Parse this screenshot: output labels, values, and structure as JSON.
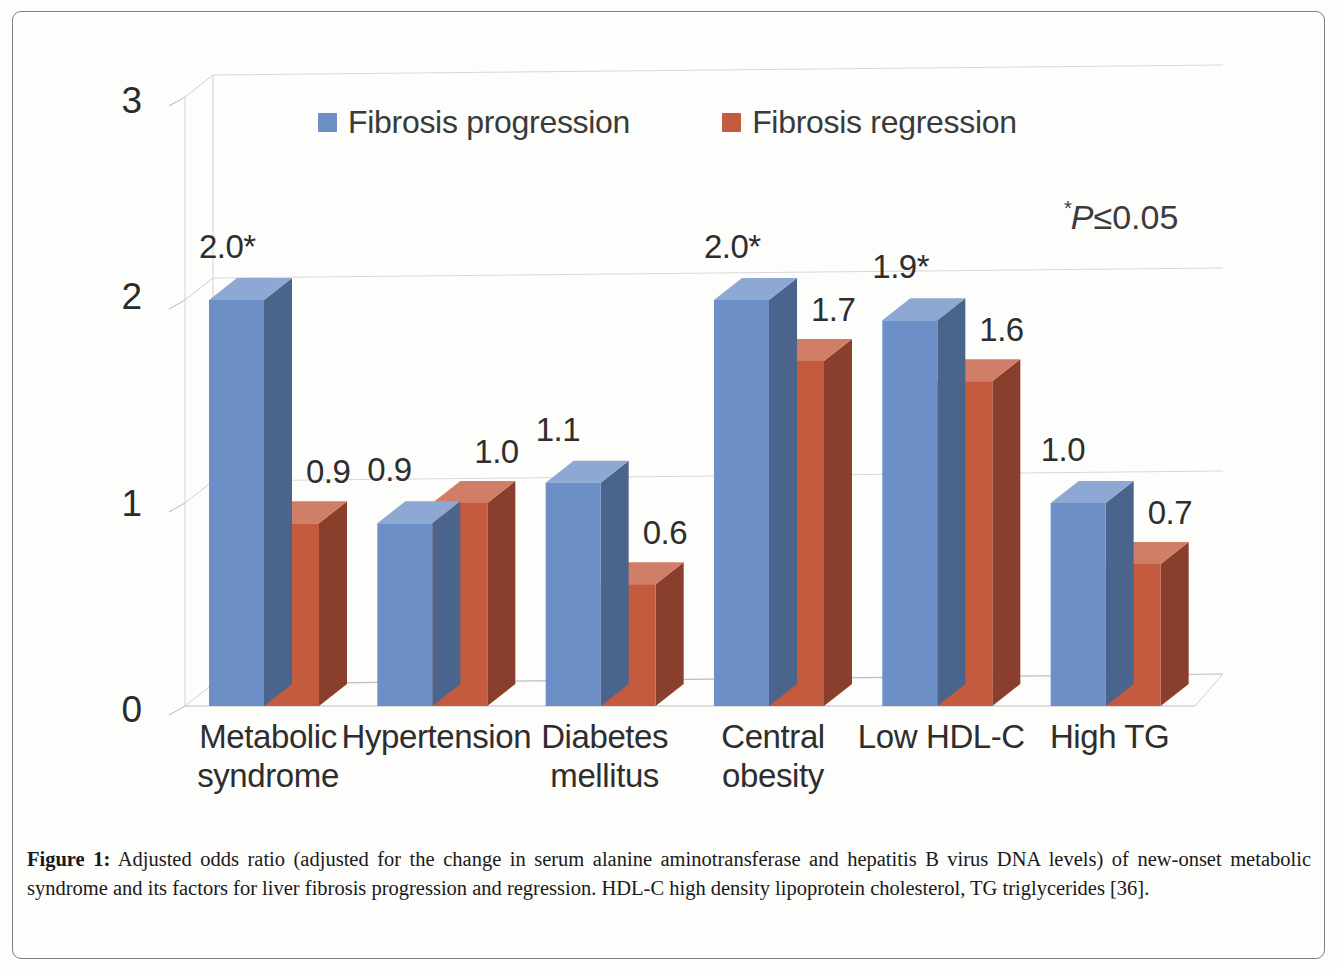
{
  "figure": {
    "caption_label": "Figure 1:",
    "caption_text": " Adjusted odds ratio (adjusted for the change in serum alanine aminotransferase and hepatitis B virus DNA levels) of new-onset metabolic syndrome and its factors for liver fibrosis progression and regression. HDL-C high density lipoprotein cholesterol, TG triglycerides [36]."
  },
  "annotation": {
    "significance_star": "*",
    "significance_text": "P≤0.05"
  },
  "legend": {
    "items": [
      {
        "label": "Fibrosis progression",
        "color": "#6b8fc6"
      },
      {
        "label": "Fibrosis regression",
        "color": "#c45a3e"
      }
    ]
  },
  "axis": {
    "y_ticks": [
      "0",
      "1",
      "2",
      "3"
    ]
  },
  "chart_data": {
    "type": "bar",
    "title": "",
    "subtitle": "",
    "xlabel": "",
    "ylabel": "",
    "ylim": [
      0,
      3
    ],
    "yticks": [
      0,
      1,
      2,
      3
    ],
    "grid": true,
    "legend_position": "top-center",
    "three_d": true,
    "annotations": [
      "*P≤0.05"
    ],
    "categories": [
      "Metabolic syndrome",
      "Hypertension",
      "Diabetes mellitus",
      "Central obesity",
      "Low HDL-C",
      "High TG"
    ],
    "category_lines": [
      [
        "Metabolic",
        "syndrome"
      ],
      [
        "Hypertension",
        ""
      ],
      [
        "Diabetes",
        "mellitus"
      ],
      [
        "Central",
        "obesity"
      ],
      [
        "Low HDL-C",
        ""
      ],
      [
        "High TG",
        ""
      ]
    ],
    "series": [
      {
        "name": "Fibrosis progression",
        "color": "#6b8fc6",
        "values": [
          2.0,
          0.9,
          1.1,
          2.0,
          1.9,
          1.0
        ],
        "labels": [
          "2.0*",
          "0.9",
          "1.1",
          "2.0*",
          "1.9*",
          "1.0"
        ]
      },
      {
        "name": "Fibrosis regression",
        "color": "#c45a3e",
        "values": [
          0.9,
          1.0,
          0.6,
          1.7,
          1.6,
          0.7
        ],
        "labels": [
          "0.9",
          "1.0",
          "0.6",
          "1.7",
          "1.6",
          "0.7"
        ]
      }
    ]
  }
}
